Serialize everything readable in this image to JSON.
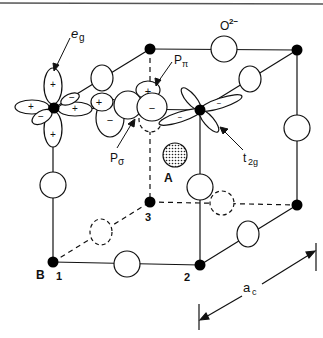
{
  "diagram": {
    "labels": {
      "eg": "e",
      "eg_sub": "g",
      "oxygen": "O",
      "oxygen_sup": "2−",
      "p_pi": "P",
      "p_pi_sub": "π",
      "p_sigma": "P",
      "p_sigma_sub": "σ",
      "t2g": "t",
      "t2g_sub": "2g",
      "site_a": "A",
      "site_b": "B",
      "vertex_1": "1",
      "vertex_2": "2",
      "vertex_3": "3",
      "lattice_param": "a",
      "lattice_param_sub": "c"
    },
    "signs": {
      "plus": "+",
      "minus": "−"
    },
    "colors": {
      "line": "#111111",
      "atom_b": "#000000",
      "atom_o": "#ffffff",
      "background": "#ffffff"
    }
  }
}
